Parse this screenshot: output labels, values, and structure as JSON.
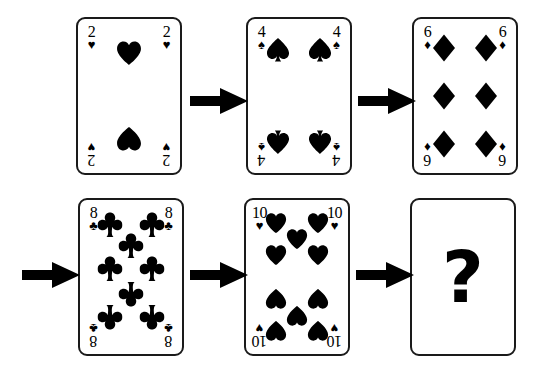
{
  "puzzle": {
    "title": "Playing card sequence puzzle",
    "background_color": "#ffffff",
    "ink_color": "#000000",
    "question_symbol": "?",
    "cards": [
      {
        "id": "card-1",
        "rank": "2",
        "suit": "hearts",
        "suit_symbol": "♥",
        "pip_count": 2,
        "corner_rank": "2",
        "corner_suit": "♥",
        "x": 76,
        "y": 17
      },
      {
        "id": "card-2",
        "rank": "4",
        "suit": "spades",
        "suit_symbol": "♠",
        "pip_count": 4,
        "corner_rank": "4",
        "corner_suit": "♠",
        "x": 246,
        "y": 17
      },
      {
        "id": "card-3",
        "rank": "6",
        "suit": "diamonds",
        "suit_symbol": "♦",
        "pip_count": 6,
        "corner_rank": "6",
        "corner_suit": "♦",
        "x": 412,
        "y": 17
      },
      {
        "id": "card-4",
        "rank": "8",
        "suit": "clubs",
        "suit_symbol": "♣",
        "pip_count": 8,
        "corner_rank": "8",
        "corner_suit": "♣",
        "x": 78,
        "y": 198
      },
      {
        "id": "card-5",
        "rank": "10",
        "suit": "hearts",
        "suit_symbol": "♥",
        "pip_count": 10,
        "corner_rank": "10",
        "corner_suit": "♥",
        "x": 244,
        "y": 198
      },
      {
        "id": "card-6",
        "rank": "?",
        "suit": "unknown",
        "suit_symbol": "",
        "pip_count": 0,
        "corner_rank": "",
        "corner_suit": "",
        "x": 410,
        "y": 198
      }
    ],
    "arrows": [
      {
        "id": "arrow-1",
        "from": "card-1",
        "to": "card-2",
        "x": 190,
        "y": 88,
        "direction": "right"
      },
      {
        "id": "arrow-2",
        "from": "card-2",
        "to": "card-3",
        "x": 358,
        "y": 88,
        "direction": "right"
      },
      {
        "id": "arrow-3",
        "from": "card-3",
        "to": "card-4",
        "x": 22,
        "y": 262,
        "direction": "right"
      },
      {
        "id": "arrow-4",
        "from": "card-4",
        "to": "card-5",
        "x": 190,
        "y": 262,
        "direction": "right"
      },
      {
        "id": "arrow-5",
        "from": "card-5",
        "to": "card-6",
        "x": 356,
        "y": 262,
        "direction": "right"
      }
    ]
  }
}
